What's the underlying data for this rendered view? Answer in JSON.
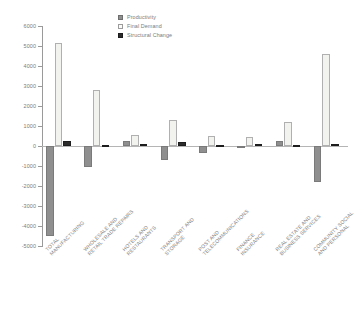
{
  "chart_data": {
    "type": "bar",
    "title": "",
    "xlabel": "",
    "ylabel": "",
    "ylim": [
      -5000,
      6000
    ],
    "ytick_step": 1000,
    "grid": false,
    "legend_position": "top-center",
    "categories": [
      "TOTAL MANUFACTURING",
      "WHOLESALE AND RETAIL TRADE REPAIRS",
      "HOTELS AND RESTAURANTS",
      "TRANSPORT AND STORAGE",
      "POST AND TELECOMMUNICATIONS",
      "FINANCE INSURANCE",
      "REAL ESTATE AND BUSINESS SERVICES",
      "COMMUNITY SOCIAL AND PERSONAL"
    ],
    "category_lines": [
      [
        "TOTAL",
        "MANUFACTURING"
      ],
      [
        "WHOLESALE AND",
        "RETAIL TRADE REPAIRS"
      ],
      [
        "HOTELS AND",
        "RESTAURANTS"
      ],
      [
        "TRANSPORT AND",
        "STORAGE"
      ],
      [
        "POST AND",
        "TELECOMMUNICATIONS"
      ],
      [
        "FINANCE",
        "INSURANCE"
      ],
      [
        "REAL ESTATE AND",
        "BUSINESS SERVICES"
      ],
      [
        "COMMUNITY SOCIAL",
        "AND PERSONAL"
      ]
    ],
    "yticks": [
      6000,
      5000,
      4000,
      3000,
      2000,
      1000,
      0,
      -1000,
      -2000,
      -3000,
      -4000,
      -5000
    ],
    "ytick_labels": [
      "6000",
      "5000",
      "4000",
      "3000",
      "2000",
      "1000",
      "0",
      "-1000",
      "-2000",
      "-3000",
      "-4000",
      "-5000"
    ],
    "series": [
      {
        "name": "Productivity",
        "color": "#8f8f8f",
        "values": [
          -4520,
          -1070,
          240,
          -680,
          -330,
          -80,
          240,
          -1820
        ]
      },
      {
        "name": "Final Demand",
        "color": "#f2f2ee",
        "values": [
          5150,
          2800,
          570,
          1300,
          490,
          430,
          1220,
          4610
        ]
      },
      {
        "name": "Structural Change",
        "color": "#2b2b2b",
        "values": [
          250,
          60,
          110,
          190,
          30,
          110,
          40,
          120
        ]
      }
    ]
  },
  "legend": {
    "items": [
      {
        "label": "Productivity",
        "swatch": "productivity"
      },
      {
        "label": "Final Demand",
        "swatch": "final"
      },
      {
        "label": "Structural Change",
        "swatch": "structural"
      }
    ]
  }
}
